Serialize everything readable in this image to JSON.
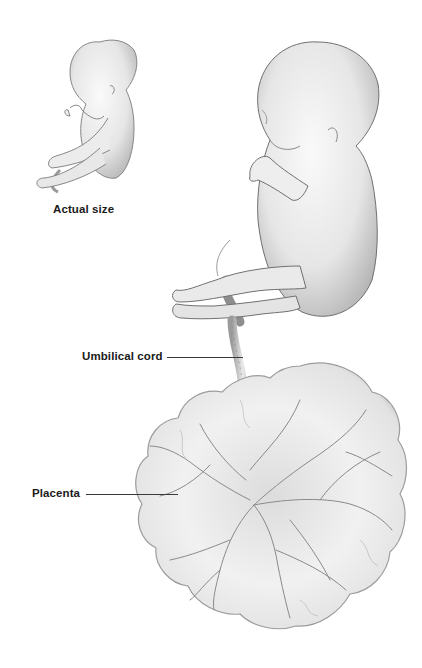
{
  "figure": {
    "labels": {
      "actual_size": "Actual size",
      "umbilical_cord": "Umbilical cord",
      "placenta": "Placenta"
    },
    "colors": {
      "background": "#ffffff",
      "label_text": "#1a1a1a",
      "leader_line": "#3a3a3a",
      "skin_light": "#f4f4f4",
      "skin_shade": "#b8b8b8",
      "outline": "#7a7a7a",
      "vessel": "#8a8a8a"
    }
  }
}
